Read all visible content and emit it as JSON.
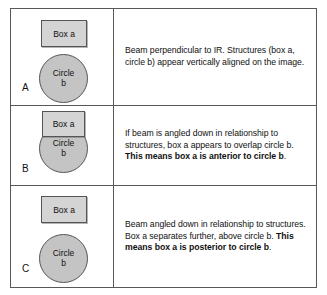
{
  "figure": {
    "panels": [
      {
        "label": "A",
        "shapes": {
          "box_label": "Box a",
          "circle_label_line1": "Circle",
          "circle_label_line2": "b"
        },
        "description_plain": "Beam perpendicular to IR. Structures (box a, circle b) appear vertically aligned on the image.",
        "description_parts": {
          "normal_1": "Beam perpendicular to IR. Structures (box a, circle b) appear vertically aligned on the image.",
          "bold_1": "",
          "normal_2": ""
        }
      },
      {
        "label": "B",
        "shapes": {
          "box_label": "Box a",
          "circle_label_line1": "Circle",
          "circle_label_line2": "b"
        },
        "description_plain": "If beam is angled down in relationship to structures, box a appears to overlap circle b. This means box a is anterior to circle b.",
        "description_parts": {
          "normal_1": "If beam is angled down in relationship to structures, box a appears to overlap circle b. ",
          "bold_1": "This means box a is anterior to circle b",
          "normal_2": "."
        }
      },
      {
        "label": "C",
        "shapes": {
          "box_label": "Box a",
          "circle_label_line1": "Circle",
          "circle_label_line2": "b"
        },
        "description_plain": "Beam angled down in relationship to structures. Box a separates further, above circle b. This means box a is posterior to circle b.",
        "description_parts": {
          "normal_1": "Beam angled down in relationship to structures. Box a separates further, above circle b. ",
          "bold_1": "This means box a is posterior to circle b",
          "normal_2": "."
        }
      }
    ],
    "colors": {
      "border": "#585858",
      "box_fill": "#d4d4d4",
      "circle_fill": "#c4c4c4",
      "text": "#111111",
      "background": "#ffffff"
    }
  }
}
